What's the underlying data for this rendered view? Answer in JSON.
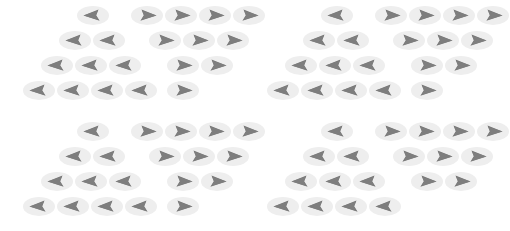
{
  "canvas": {
    "width": 488,
    "height": 231,
    "background": "#ffffff"
  },
  "style": {
    "capsule_color": "#eeeeee",
    "glyph_color": "#808080",
    "glyph_color_dark": "#767676",
    "token_width": 34,
    "token_height": 19,
    "row_height": 25,
    "icon_left": "arrow-left-dart-icon",
    "icon_right": "arrow-right-dart-icon"
  },
  "legend": {
    "left_glyph_name": "arrow-left-dart-icon",
    "right_glyph_name": "arrow-right-dart-icon"
  },
  "layout": {
    "macro_columns": 2,
    "macro_rows": 2,
    "macro_cell_width": 244,
    "macro_cell_height": 116
  },
  "blocks": [
    {
      "id": "block-top-left",
      "name": "block-1",
      "origin_x": 0,
      "origin_y": 0,
      "clusters": [
        {
          "id": "cluster-1-left",
          "name": "left-pyramid",
          "direction": "left",
          "shape": "pyramid",
          "origin_x": 22,
          "origin_y": 6,
          "row_counts": [
            1,
            2,
            3,
            4
          ],
          "row_indent": [
            3,
            2,
            1,
            0
          ]
        },
        {
          "id": "cluster-1-right",
          "name": "right-inverted-pyramid",
          "direction": "right",
          "shape": "inverted-pyramid",
          "origin_x": 130,
          "origin_y": 6,
          "row_counts": [
            4,
            3,
            2,
            1
          ],
          "row_indent": [
            0,
            1,
            2,
            2
          ]
        }
      ]
    },
    {
      "id": "block-top-right",
      "name": "block-2",
      "origin_x": 244,
      "origin_y": 0,
      "clusters": [
        {
          "id": "cluster-2-left",
          "name": "left-pyramid",
          "direction": "left",
          "shape": "pyramid",
          "origin_x": 22,
          "origin_y": 6,
          "row_counts": [
            1,
            2,
            3,
            4
          ],
          "row_indent": [
            3,
            2,
            1,
            0
          ]
        },
        {
          "id": "cluster-2-right",
          "name": "right-inverted-pyramid",
          "direction": "right",
          "shape": "inverted-pyramid",
          "origin_x": 130,
          "origin_y": 6,
          "row_counts": [
            4,
            3,
            2,
            1
          ],
          "row_indent": [
            0,
            1,
            2,
            2
          ]
        }
      ]
    },
    {
      "id": "block-bottom-left",
      "name": "block-3",
      "origin_x": 0,
      "origin_y": 116,
      "clusters": [
        {
          "id": "cluster-3-left",
          "name": "left-pyramid",
          "direction": "left",
          "shape": "pyramid",
          "origin_x": 22,
          "origin_y": 6,
          "row_counts": [
            1,
            2,
            3,
            4
          ],
          "row_indent": [
            3,
            2,
            1,
            0
          ]
        },
        {
          "id": "cluster-3-right",
          "name": "right-inverted-pyramid",
          "direction": "right",
          "shape": "inverted-pyramid",
          "origin_x": 130,
          "origin_y": 6,
          "row_counts": [
            4,
            3,
            2,
            1
          ],
          "row_indent": [
            0,
            1,
            2,
            2
          ]
        }
      ]
    },
    {
      "id": "block-bottom-right",
      "name": "block-4",
      "origin_x": 244,
      "origin_y": 116,
      "clusters": [
        {
          "id": "cluster-4-left",
          "name": "left-pyramid",
          "direction": "left",
          "shape": "pyramid",
          "origin_x": 22,
          "origin_y": 6,
          "row_counts": [
            1,
            2,
            3,
            4
          ],
          "row_indent": [
            3,
            2,
            1,
            0
          ]
        },
        {
          "id": "cluster-4-right",
          "name": "right-inverted-pyramid-truncated",
          "direction": "right",
          "shape": "inverted-pyramid",
          "origin_x": 130,
          "origin_y": 6,
          "row_counts": [
            4,
            3,
            2
          ],
          "row_indent": [
            0,
            1,
            2
          ]
        }
      ]
    }
  ],
  "totals": {
    "token_count": 79,
    "left_pointing_count": 40,
    "right_pointing_count": 39
  }
}
